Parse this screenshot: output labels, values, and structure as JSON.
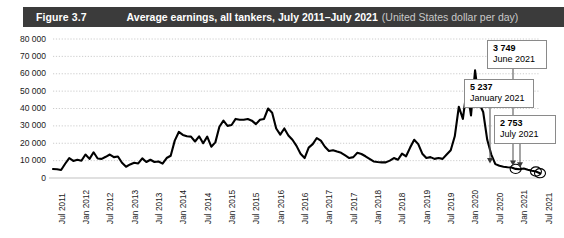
{
  "header": {
    "figure_number": "Figure 3.7",
    "title": "Average earnings, all tankers, July 2011–July 2021",
    "unit": "(United States dollar per day)",
    "bar_color": "#3b3b3b"
  },
  "chart_data": {
    "type": "line",
    "title": "Average earnings, all tankers, July 2011–July 2021",
    "xlabel": "",
    "ylabel": "United States dollar per day",
    "ylim": [
      0,
      80000
    ],
    "ytick_labels": [
      "80 000",
      "70 000",
      "60 000",
      "50 000",
      "40 000",
      "30 000",
      "20 000",
      "10 000",
      "0"
    ],
    "ytick_values": [
      80000,
      70000,
      60000,
      50000,
      40000,
      30000,
      20000,
      10000,
      0
    ],
    "grid": true,
    "grid_style": "dotted",
    "legend": "none",
    "line_color": "#000000",
    "xtick_labels": [
      "Jul 2011",
      "Jan 2012",
      "Jul 2012",
      "Jan 2013",
      "Jul 2013",
      "Jan 2014",
      "Jul 2014",
      "Jan 2015",
      "Jul 2015",
      "Jan 2016",
      "Jul 2016",
      "Jan 2017",
      "Jul 2017",
      "Jan 2018",
      "Jul 2018",
      "Jan 2019",
      "Jul 2019",
      "Jan 2020",
      "Jul 2020",
      "Jan 2021",
      "Jul 2021"
    ],
    "x": [
      "Jul 2011",
      "Aug 2011",
      "Sep 2011",
      "Oct 2011",
      "Nov 2011",
      "Dec 2011",
      "Jan 2012",
      "Feb 2012",
      "Mar 2012",
      "Apr 2012",
      "May 2012",
      "Jun 2012",
      "Jul 2012",
      "Aug 2012",
      "Sep 2012",
      "Oct 2012",
      "Nov 2012",
      "Dec 2012",
      "Jan 2013",
      "Feb 2013",
      "Mar 2013",
      "Apr 2013",
      "May 2013",
      "Jun 2013",
      "Jul 2013",
      "Aug 2013",
      "Sep 2013",
      "Oct 2013",
      "Nov 2013",
      "Dec 2013",
      "Jan 2014",
      "Feb 2014",
      "Mar 2014",
      "Apr 2014",
      "May 2014",
      "Jun 2014",
      "Jul 2014",
      "Aug 2014",
      "Sep 2014",
      "Oct 2014",
      "Nov 2014",
      "Dec 2014",
      "Jan 2015",
      "Feb 2015",
      "Mar 2015",
      "Apr 2015",
      "May 2015",
      "Jun 2015",
      "Jul 2015",
      "Aug 2015",
      "Sep 2015",
      "Oct 2015",
      "Nov 2015",
      "Dec 2015",
      "Jan 2016",
      "Feb 2016",
      "Mar 2016",
      "Apr 2016",
      "May 2016",
      "Jun 2016",
      "Jul 2016",
      "Aug 2016",
      "Sep 2016",
      "Oct 2016",
      "Nov 2016",
      "Dec 2016",
      "Jan 2017",
      "Feb 2017",
      "Mar 2017",
      "Apr 2017",
      "May 2017",
      "Jun 2017",
      "Jul 2017",
      "Aug 2017",
      "Sep 2017",
      "Oct 2017",
      "Nov 2017",
      "Dec 2017",
      "Jan 2018",
      "Feb 2018",
      "Mar 2018",
      "Apr 2018",
      "May 2018",
      "Jun 2018",
      "Jul 2018",
      "Aug 2018",
      "Sep 2018",
      "Oct 2018",
      "Nov 2018",
      "Dec 2018",
      "Jan 2019",
      "Feb 2019",
      "Mar 2019",
      "Apr 2019",
      "May 2019",
      "Jun 2019",
      "Jul 2019",
      "Aug 2019",
      "Sep 2019",
      "Oct 2019",
      "Nov 2019",
      "Dec 2019",
      "Jan 2020",
      "Feb 2020",
      "Mar 2020",
      "Apr 2020",
      "May 2020",
      "Jun 2020",
      "Jul 2020",
      "Aug 2020",
      "Sep 2020",
      "Oct 2020",
      "Nov 2020",
      "Dec 2020",
      "Jan 2021",
      "Feb 2021",
      "Mar 2021",
      "Apr 2021",
      "May 2021",
      "Jun 2021",
      "Jul 2021"
    ],
    "values": [
      5200,
      5000,
      4600,
      8200,
      11500,
      9800,
      10500,
      9900,
      13500,
      11000,
      14800,
      11200,
      11000,
      12200,
      13500,
      12000,
      12400,
      8800,
      6500,
      7800,
      8800,
      8400,
      11300,
      9200,
      10500,
      9200,
      9500,
      8300,
      11500,
      12800,
      21500,
      26500,
      24800,
      24000,
      23800,
      21000,
      24000,
      20000,
      23800,
      18000,
      20500,
      29500,
      33000,
      30000,
      30500,
      34000,
      33500,
      33500,
      34000,
      33000,
      31000,
      33500,
      34000,
      40000,
      37500,
      28500,
      25000,
      28500,
      24500,
      22000,
      18500,
      14000,
      11500,
      17500,
      19500,
      23000,
      21500,
      18000,
      15500,
      16000,
      15200,
      14500,
      13000,
      11500,
      12000,
      14500,
      13800,
      12500,
      11000,
      9500,
      9200,
      9000,
      9000,
      10000,
      11500,
      10500,
      14000,
      12500,
      17500,
      22000,
      19500,
      14000,
      11500,
      12000,
      11000,
      11500,
      11000,
      13500,
      16000,
      24000,
      41000,
      34000,
      52000,
      36000,
      62000,
      43000,
      38000,
      22000,
      13500,
      8000,
      7000,
      6500,
      6200,
      6000,
      5237,
      5000,
      5500,
      4800,
      4200,
      3749,
      2753
    ],
    "highlights": [
      {
        "value": 3749,
        "value_text": "3 749",
        "date": "June 2021"
      },
      {
        "value": 5237,
        "value_text": "5 237",
        "date": "January 2021"
      },
      {
        "value": 2753,
        "value_text": "2 753",
        "date": "July 2021"
      }
    ]
  },
  "callouts": [
    {
      "value_text": "3 749",
      "date": "June 2021"
    },
    {
      "value_text": "5 237",
      "date": "January 2021"
    },
    {
      "value_text": "2 753",
      "date": "July 2021"
    }
  ]
}
